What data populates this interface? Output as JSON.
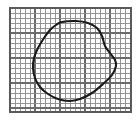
{
  "figure": {
    "background_color": "#ffffff",
    "grid": {
      "line_color": "#8a8a8a",
      "major_line_color": "#6b6b6b",
      "frame_color": "#5a5a5a",
      "cell_size_px": 5,
      "left_px": 10,
      "top_px": 8,
      "right_px": 131,
      "bottom_px": 112,
      "columns": 24,
      "rows": 21,
      "major_every": 5
    },
    "curve": {
      "color": "#1a1a1a",
      "stroke_width_px": 2.1,
      "closed": true,
      "bounds": {
        "x_min": 33,
        "y_min": 21,
        "x_max": 116,
        "y_max": 101
      },
      "points": [
        [
          62,
          22
        ],
        [
          76,
          21
        ],
        [
          88,
          23
        ],
        [
          97,
          28
        ],
        [
          102,
          36
        ],
        [
          105,
          46
        ],
        [
          110,
          53
        ],
        [
          115,
          60
        ],
        [
          116,
          66
        ],
        [
          112,
          75
        ],
        [
          103,
          84
        ],
        [
          92,
          93
        ],
        [
          80,
          99
        ],
        [
          69,
          101
        ],
        [
          58,
          99
        ],
        [
          48,
          94
        ],
        [
          40,
          87
        ],
        [
          35,
          78
        ],
        [
          33,
          68
        ],
        [
          34,
          58
        ],
        [
          38,
          48
        ],
        [
          44,
          38
        ],
        [
          50,
          30
        ],
        [
          56,
          25
        ]
      ]
    }
  }
}
